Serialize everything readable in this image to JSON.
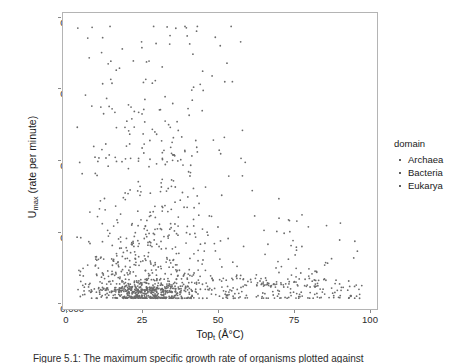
{
  "chart_data": {
    "type": "scatter",
    "title": "",
    "xlabel": "Topt (Å°C)",
    "ylabel": "Umax (rate per minute)",
    "xlim": [
      -2,
      110
    ],
    "ylim": [
      -0.004,
      0.106
    ],
    "grid": false,
    "legend_position": "right",
    "legend_title": "domain",
    "point_color": "#6b6b6b",
    "point_size_px": 1.8,
    "xticks": [
      0,
      25,
      50,
      75,
      100
    ],
    "xticklabels": [
      "0",
      "25",
      "50",
      "75",
      "100"
    ],
    "yticks": [
      0.0,
      0.025,
      0.05,
      0.075,
      0.1
    ],
    "yticklabels": [
      "0.000",
      "0.025",
      "0.050",
      "0.075",
      "0.100"
    ],
    "series": [
      {
        "name": "Archaea",
        "color": "#6b6b6b",
        "n_points": 110,
        "x_range": [
          45,
          106
        ],
        "y_range": [
          0.0,
          0.031
        ],
        "x_mode": 78,
        "y_mode": 0.004
      },
      {
        "name": "Bacteria",
        "color": "#6b6b6b",
        "n_points": 640,
        "x_range": [
          3,
          70
        ],
        "y_range": [
          0.0,
          0.101
        ],
        "x_mode": 30,
        "y_mode": 0.002
      },
      {
        "name": "Eukarya",
        "color": "#6b6b6b",
        "n_points": 90,
        "x_range": [
          5,
          45
        ],
        "y_range": [
          0.0,
          0.028
        ],
        "x_mode": 25,
        "y_mode": 0.003
      }
    ],
    "notable_points": [
      {
        "x": 42.0,
        "y": 0.1005
      },
      {
        "x": 42.3,
        "y": 0.0975
      },
      {
        "x": 43.2,
        "y": 0.0945
      },
      {
        "x": 42.6,
        "y": 0.0705
      },
      {
        "x": 43.0,
        "y": 0.068
      },
      {
        "x": 41.5,
        "y": 0.0545
      },
      {
        "x": 40.8,
        "y": 0.0495
      },
      {
        "x": 42.8,
        "y": 0.047
      },
      {
        "x": 61.5,
        "y": 0.052
      },
      {
        "x": 63.0,
        "y": 0.0505
      },
      {
        "x": 62.0,
        "y": 0.0455
      },
      {
        "x": 65.5,
        "y": 0.04
      },
      {
        "x": 75.0,
        "y": 0.037
      },
      {
        "x": 92.0,
        "y": 0.027
      },
      {
        "x": 103.0,
        "y": 0.0175
      }
    ]
  },
  "axes": {
    "x_title": "Top",
    "x_title_sub": "t",
    "x_title_unit": " (Å°C)",
    "y_title": "U",
    "y_title_sub": "max",
    "y_title_unit": " (rate per minute)"
  },
  "legend": {
    "title": "domain",
    "items": [
      {
        "label": "Archaea"
      },
      {
        "label": "Bacteria"
      },
      {
        "label": "Eukarya"
      }
    ]
  },
  "caption": {
    "text": "Figure 5.1: The maximum specific growth rate of organisms plotted against"
  }
}
